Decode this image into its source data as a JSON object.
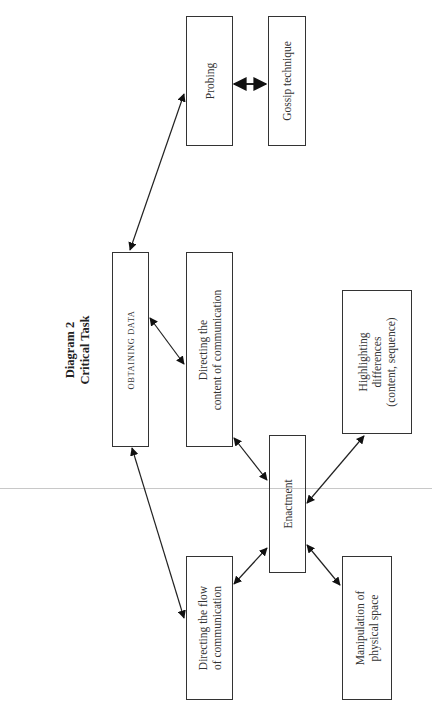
{
  "diagram": {
    "title_line1": "Diagram 2",
    "title_line2": "Critical Task",
    "orientation": "rotated 90° counter-clockwise",
    "nodes": {
      "obtaining_data": {
        "label": "OBTAINING DATA"
      },
      "probing": {
        "label": "Probing"
      },
      "gossip": {
        "label": "Gossip technique"
      },
      "directing_content": {
        "line1": "Directing the",
        "line2": "content of communication"
      },
      "directing_flow": {
        "line1": "Directing the flow",
        "line2": "of communication"
      },
      "enactment": {
        "label": "Enactment"
      },
      "highlighting": {
        "line1": "Highlighting",
        "line2": "differences",
        "line3": "(content, sequence)"
      },
      "manipulation": {
        "line1": "Manipulation of",
        "line2": "physical space"
      }
    },
    "edges": [
      {
        "from": "Obtaining data",
        "to": "Probing",
        "type": "bidirectional"
      },
      {
        "from": "Probing",
        "to": "Gossip technique",
        "type": "bidirectional"
      },
      {
        "from": "Obtaining data",
        "to": "Directing the content of communication",
        "type": "bidirectional"
      },
      {
        "from": "Obtaining data",
        "to": "Directing the flow of communication",
        "type": "bidirectional"
      },
      {
        "from": "Directing the content of communication",
        "to": "Enactment",
        "type": "bidirectional"
      },
      {
        "from": "Directing the flow of communication",
        "to": "Enactment",
        "type": "bidirectional"
      },
      {
        "from": "Enactment",
        "to": "Highlighting differences (content, sequence)",
        "type": "bidirectional"
      },
      {
        "from": "Enactment",
        "to": "Manipulation of physical space",
        "type": "bidirectional"
      }
    ],
    "colors": {
      "line": "#333333",
      "background": "#ffffff",
      "scan_line": "#c8c8c8"
    }
  }
}
